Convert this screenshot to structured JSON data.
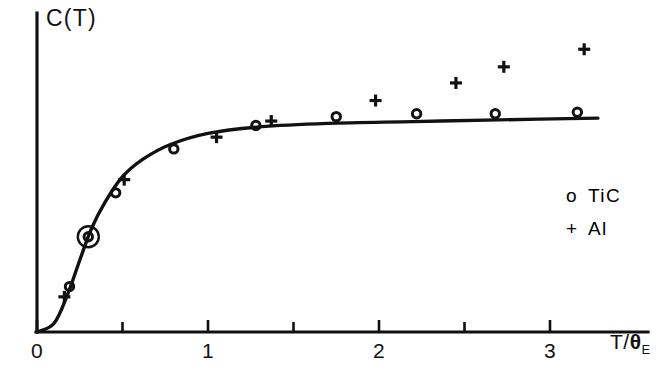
{
  "figure": {
    "name": "einstein-heat-capacity-figure",
    "axis_color": "#111111",
    "curve_color": "#111111",
    "background": "#ffffff"
  },
  "labels": {
    "y_axis": "C(T)",
    "x_axis_main": "T/",
    "x_axis_theta": "θ",
    "x_axis_sub": "E"
  },
  "axis": {
    "x_ticks_major": [
      "0",
      "1",
      "2",
      "3"
    ],
    "x_ticks_minor": [
      "0.5",
      "1.5",
      "2.5"
    ]
  },
  "legend": {
    "entries": [
      {
        "symbol": "o",
        "label": "TiC"
      },
      {
        "symbol": "+",
        "label": "Al"
      }
    ]
  },
  "chart_data": {
    "type": "scatter",
    "title": "",
    "xlabel": "T/θE",
    "ylabel": "C(T)",
    "xlim": [
      0,
      3.4
    ],
    "ylim": [
      0,
      1.15
    ],
    "grid": false,
    "legend_position": "right-middle",
    "x_tick_values": [
      0,
      0.5,
      1,
      1.5,
      2,
      2.5,
      3
    ],
    "x_tick_labels": [
      "0",
      "",
      "1",
      "",
      "2",
      "",
      "3"
    ],
    "annotations": [
      {
        "kind": "highlight-circle",
        "x": 0.3,
        "y": 0.325,
        "note": "circled TiC data point"
      }
    ],
    "series": [
      {
        "name": "TiC",
        "marker": "o",
        "points": [
          {
            "x": 0.19,
            "y": 0.155
          },
          {
            "x": 0.3,
            "y": 0.325
          },
          {
            "x": 0.46,
            "y": 0.475
          },
          {
            "x": 0.8,
            "y": 0.625
          },
          {
            "x": 1.28,
            "y": 0.705
          },
          {
            "x": 1.75,
            "y": 0.735
          },
          {
            "x": 2.22,
            "y": 0.745
          },
          {
            "x": 2.68,
            "y": 0.745
          },
          {
            "x": 3.16,
            "y": 0.75
          }
        ]
      },
      {
        "name": "Al",
        "marker": "+",
        "points": [
          {
            "x": 0.16,
            "y": 0.12
          },
          {
            "x": 0.51,
            "y": 0.52
          },
          {
            "x": 1.05,
            "y": 0.665
          },
          {
            "x": 1.37,
            "y": 0.72
          },
          {
            "x": 1.98,
            "y": 0.79
          },
          {
            "x": 2.45,
            "y": 0.85
          },
          {
            "x": 2.73,
            "y": 0.905
          },
          {
            "x": 3.2,
            "y": 0.965
          }
        ]
      },
      {
        "name": "Einstein model curve",
        "marker": "line",
        "points": [
          {
            "x": 0.0,
            "y": 0.0
          },
          {
            "x": 0.1,
            "y": 0.03
          },
          {
            "x": 0.18,
            "y": 0.13
          },
          {
            "x": 0.25,
            "y": 0.245
          },
          {
            "x": 0.32,
            "y": 0.355
          },
          {
            "x": 0.4,
            "y": 0.445
          },
          {
            "x": 0.5,
            "y": 0.53
          },
          {
            "x": 0.62,
            "y": 0.59
          },
          {
            "x": 0.78,
            "y": 0.64
          },
          {
            "x": 1.0,
            "y": 0.678
          },
          {
            "x": 1.3,
            "y": 0.7
          },
          {
            "x": 1.7,
            "y": 0.712
          },
          {
            "x": 2.2,
            "y": 0.718
          },
          {
            "x": 2.7,
            "y": 0.724
          },
          {
            "x": 3.28,
            "y": 0.73
          }
        ]
      }
    ]
  }
}
